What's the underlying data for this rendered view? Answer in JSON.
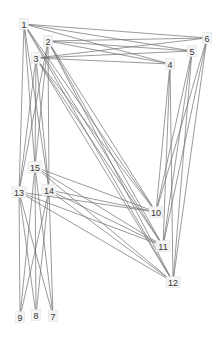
{
  "diagram": {
    "type": "network-graph",
    "nodes": [
      {
        "id": "1",
        "label": "1",
        "x": 24,
        "y": 24
      },
      {
        "id": "2",
        "label": "2",
        "x": 48,
        "y": 41
      },
      {
        "id": "3",
        "label": "3",
        "x": 36,
        "y": 58
      },
      {
        "id": "4",
        "label": "4",
        "x": 170,
        "y": 64
      },
      {
        "id": "5",
        "label": "5",
        "x": 192,
        "y": 51
      },
      {
        "id": "6",
        "label": "6",
        "x": 207,
        "y": 38
      },
      {
        "id": "7",
        "label": "7",
        "x": 53,
        "y": 316
      },
      {
        "id": "8",
        "label": "8",
        "x": 36,
        "y": 315
      },
      {
        "id": "9",
        "label": "9",
        "x": 20,
        "y": 317
      },
      {
        "id": "10",
        "label": "10",
        "x": 156,
        "y": 212
      },
      {
        "id": "11",
        "label": "11",
        "x": 163,
        "y": 246
      },
      {
        "id": "12",
        "label": "12",
        "x": 173,
        "y": 282
      },
      {
        "id": "13",
        "label": "13",
        "x": 19,
        "y": 192
      },
      {
        "id": "14",
        "label": "14",
        "x": 49,
        "y": 190
      },
      {
        "id": "15",
        "label": "15",
        "x": 35,
        "y": 167
      }
    ],
    "edges": [
      [
        "1",
        "4"
      ],
      [
        "1",
        "5"
      ],
      [
        "1",
        "6"
      ],
      [
        "2",
        "4"
      ],
      [
        "2",
        "5"
      ],
      [
        "2",
        "6"
      ],
      [
        "3",
        "4"
      ],
      [
        "3",
        "5"
      ],
      [
        "3",
        "6"
      ],
      [
        "1",
        "10"
      ],
      [
        "1",
        "11"
      ],
      [
        "1",
        "12"
      ],
      [
        "2",
        "10"
      ],
      [
        "2",
        "11"
      ],
      [
        "2",
        "12"
      ],
      [
        "3",
        "10"
      ],
      [
        "3",
        "11"
      ],
      [
        "3",
        "12"
      ],
      [
        "1",
        "13"
      ],
      [
        "1",
        "14"
      ],
      [
        "1",
        "15"
      ],
      [
        "2",
        "13"
      ],
      [
        "2",
        "14"
      ],
      [
        "2",
        "15"
      ],
      [
        "3",
        "13"
      ],
      [
        "3",
        "14"
      ],
      [
        "3",
        "15"
      ],
      [
        "4",
        "10"
      ],
      [
        "4",
        "11"
      ],
      [
        "4",
        "12"
      ],
      [
        "5",
        "10"
      ],
      [
        "5",
        "11"
      ],
      [
        "5",
        "12"
      ],
      [
        "6",
        "10"
      ],
      [
        "6",
        "11"
      ],
      [
        "6",
        "12"
      ],
      [
        "13",
        "10"
      ],
      [
        "13",
        "11"
      ],
      [
        "13",
        "12"
      ],
      [
        "14",
        "10"
      ],
      [
        "14",
        "11"
      ],
      [
        "14",
        "12"
      ],
      [
        "15",
        "10"
      ],
      [
        "15",
        "11"
      ],
      [
        "15",
        "12"
      ],
      [
        "13",
        "7"
      ],
      [
        "13",
        "8"
      ],
      [
        "13",
        "9"
      ],
      [
        "14",
        "7"
      ],
      [
        "14",
        "8"
      ],
      [
        "14",
        "9"
      ],
      [
        "15",
        "7"
      ],
      [
        "15",
        "8"
      ],
      [
        "15",
        "9"
      ]
    ]
  }
}
